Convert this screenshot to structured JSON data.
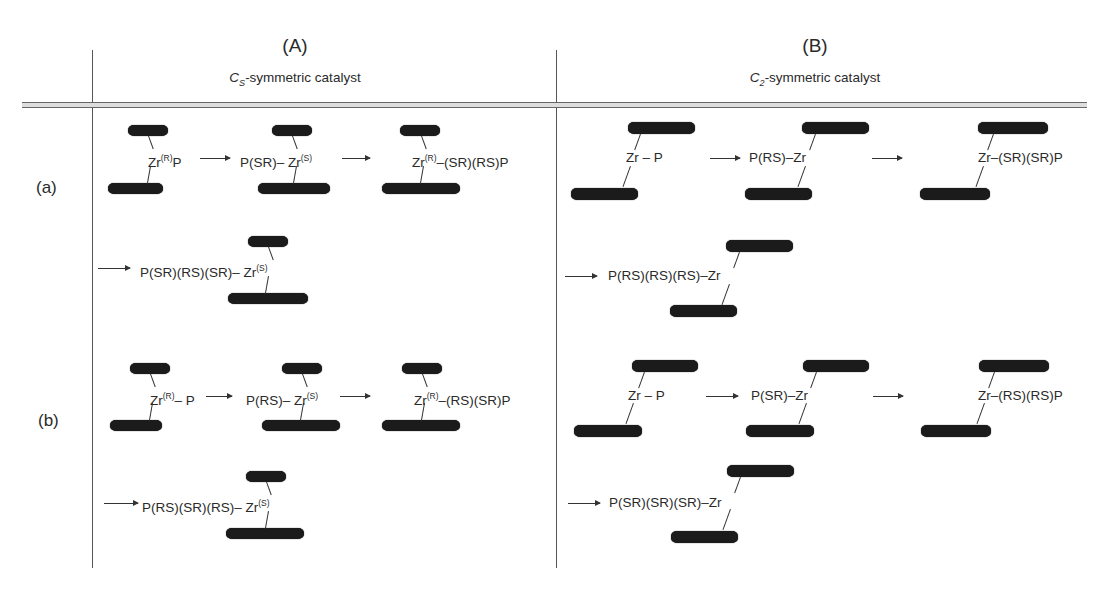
{
  "columns": [
    {
      "label": "(A)",
      "subtitle_symbol": "C",
      "subtitle_sub": "S",
      "subtitle_text": "-symmetric catalyst"
    },
    {
      "label": "(B)",
      "subtitle_symbol": "C",
      "subtitle_sub": "2",
      "subtitle_text": "-symmetric catalyst"
    }
  ],
  "rows": [
    {
      "label": "(a)"
    },
    {
      "label": "(b)"
    }
  ],
  "cells": {
    "A_a": {
      "step1": {
        "main": "Zr",
        "sup": "(R)",
        "tail": "P"
      },
      "step2": {
        "pre": "P(SR)– Zr",
        "sup": "(S)"
      },
      "step3": {
        "main": "Zr",
        "sup": "(R)",
        "tail": "–(SR)(RS)P"
      },
      "step4": {
        "pre": "P(SR)(RS)(SR)– Zr",
        "sup": "(S)"
      }
    },
    "A_b": {
      "step1": {
        "main": "Zr",
        "sup": "(R)",
        "tail": "– P"
      },
      "step2": {
        "pre": "P(RS)– Zr",
        "sup": "(S)"
      },
      "step3": {
        "main": "Zr",
        "sup": "(R)",
        "tail": "–(RS)(SR)P"
      },
      "step4": {
        "pre": "P(RS)(SR)(RS)– Zr",
        "sup": "(S)"
      }
    },
    "B_a": {
      "step1": "Zr – P",
      "step2": "P(RS)–Zr",
      "step3": "Zr–(SR)(SR)P",
      "step4": "P(RS)(RS)(RS)–Zr"
    },
    "B_b": {
      "step1": "Zr – P",
      "step2": "P(SR)–Zr",
      "step3": "Zr–(RS)(RS)P",
      "step4": "P(SR)(SR)(SR)–Zr"
    }
  },
  "colors": {
    "ligand_bar": "#1b1b1b",
    "line": "#555555",
    "text": "#2a2a2a"
  }
}
